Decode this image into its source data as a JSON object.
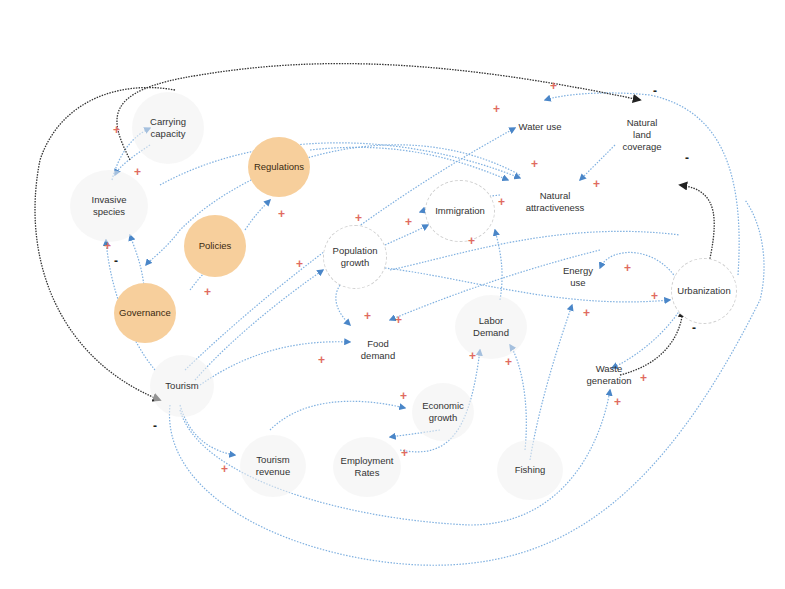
{
  "diagram": {
    "type": "causal-loop-diagram",
    "colors": {
      "positive_link": "#5b9bd5",
      "negative_link": "#333333",
      "plus_sign": "#e06a60",
      "minus_sign": "#222222",
      "policy_node_fill": "#f7cf9c",
      "node_fill": "#f2f2f2"
    },
    "nodes": {
      "carrying_capacity": "Carrying\ncapacity",
      "invasive_species": "Invasive\nspecies",
      "regulations": "Regulations",
      "policies": "Policies",
      "governance": "Governance",
      "water_use": "Water use",
      "natural_land_coverage": "Natural\nland\ncoverage",
      "natural_attractiveness": "Natural\nattractiveness",
      "immigration": "Immigration",
      "population_growth": "Population\ngrowth",
      "energy_use": "Energy\nuse",
      "urbanization": "Urbanization",
      "labor_demand": "Labor\nDemand",
      "food_demand": "Food\ndemand",
      "waste_generation": "Waste\ngeneration",
      "tourism": "Tourism",
      "economic_growth": "Economic\ngrowth",
      "tourism_revenue": "Tourism\nrevenue",
      "employment_rates": "Employment\nRates",
      "fishing": "Fishing"
    },
    "links": [
      {
        "from": "Invasive species",
        "to": "Carrying capacity",
        "polarity": "+"
      },
      {
        "from": "Carrying capacity",
        "to": "Invasive species",
        "polarity": "+"
      },
      {
        "from": "Governance",
        "to": "Invasive species",
        "polarity": "-"
      },
      {
        "from": "Tourism",
        "to": "Invasive species",
        "polarity": "+"
      },
      {
        "from": "Governance",
        "to": "Policies",
        "polarity": "+"
      },
      {
        "from": "Policies",
        "to": "Regulations",
        "polarity": "+"
      },
      {
        "from": "Natural attractiveness",
        "to": "Governance",
        "polarity": "+"
      },
      {
        "from": "Tourism",
        "to": "Water use",
        "polarity": "+"
      },
      {
        "from": "Urbanization",
        "to": "Water use",
        "polarity": "+"
      },
      {
        "from": "Carrying capacity",
        "to": "Natural land coverage",
        "polarity": "-"
      },
      {
        "from": "Urbanization",
        "to": "Natural land coverage",
        "polarity": "-"
      },
      {
        "from": "Natural land coverage",
        "to": "Natural attractiveness",
        "polarity": "+"
      },
      {
        "from": "Invasive species",
        "to": "Natural attractiveness",
        "polarity": "+"
      },
      {
        "from": "Regulations",
        "to": "Natural attractiveness",
        "polarity": "+"
      },
      {
        "from": "Natural attractiveness",
        "to": "Immigration",
        "polarity": "+"
      },
      {
        "from": "Immigration",
        "to": "Population growth",
        "polarity": "+"
      },
      {
        "from": "Population growth",
        "to": "Immigration",
        "polarity": "+"
      },
      {
        "from": "Labor Demand",
        "to": "Immigration",
        "polarity": "+"
      },
      {
        "from": "Tourism",
        "to": "Population growth",
        "polarity": "+"
      },
      {
        "from": "Population growth",
        "to": "Food demand",
        "polarity": "+"
      },
      {
        "from": "Energy use",
        "to": "Food demand",
        "polarity": "+"
      },
      {
        "from": "Tourism",
        "to": "Food demand",
        "polarity": "+"
      },
      {
        "from": "Population growth",
        "to": "Urbanization",
        "polarity": "+"
      },
      {
        "from": "Urbanization",
        "to": "Energy use",
        "polarity": "+"
      },
      {
        "from": "Fishing",
        "to": "Energy use",
        "polarity": "+"
      },
      {
        "from": "Urbanization",
        "to": "Waste generation",
        "polarity": "+"
      },
      {
        "from": "Waste generation",
        "to": "Urbanization",
        "polarity": "-"
      },
      {
        "from": "Tourism",
        "to": "Waste generation",
        "polarity": "+"
      },
      {
        "from": "Employment Rates",
        "to": "Labor Demand",
        "polarity": "+"
      },
      {
        "from": "Fishing",
        "to": "Labor Demand",
        "polarity": "+"
      },
      {
        "from": "Tourism revenue",
        "to": "Economic growth",
        "polarity": "+"
      },
      {
        "from": "Economic growth",
        "to": "Employment Rates",
        "polarity": "+"
      },
      {
        "from": "Tourism",
        "to": "Tourism revenue",
        "polarity": "+"
      },
      {
        "from": "Carrying capacity",
        "to": "Tourism",
        "polarity": "-"
      }
    ]
  }
}
